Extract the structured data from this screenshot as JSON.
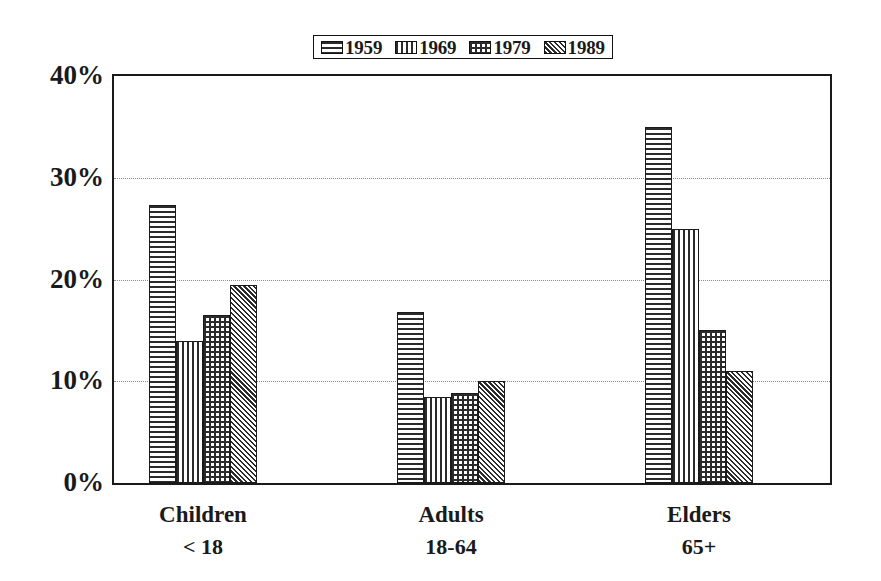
{
  "chart_data": {
    "type": "bar",
    "title": "",
    "subtitle": "",
    "xlabel": "",
    "ylabel": "",
    "ylim": [
      0,
      40
    ],
    "yunit": "%",
    "ytick_labels": [
      "40%",
      "30%",
      "20%",
      "10%",
      "0%"
    ],
    "ytick_values": [
      40,
      30,
      20,
      10,
      0
    ],
    "gridlines": [
      30,
      20,
      10
    ],
    "grid": true,
    "grid_style": "dotted",
    "legend_position": "top-center",
    "categories": [
      "Children",
      "Adults",
      "Elders"
    ],
    "category_sublabels": [
      "< 18",
      "18-64",
      "65+"
    ],
    "series": [
      {
        "name": "1959",
        "pattern": "horizontal",
        "values": [
          27.3,
          16.8,
          35.0
        ]
      },
      {
        "name": "1969",
        "pattern": "vertical",
        "values": [
          14.0,
          8.5,
          25.0
        ]
      },
      {
        "name": "1979",
        "pattern": "grid",
        "values": [
          16.5,
          8.8,
          15.0
        ]
      },
      {
        "name": "1989",
        "pattern": "diagonal",
        "values": [
          19.5,
          10.0,
          11.0
        ]
      }
    ]
  },
  "legend": {
    "entries": [
      {
        "label": "1959",
        "pattern": "horizontal"
      },
      {
        "label": "1969",
        "pattern": "vertical"
      },
      {
        "label": "1979",
        "pattern": "grid"
      },
      {
        "label": "1989",
        "pattern": "diagonal"
      }
    ]
  },
  "colors": {
    "ink": "#1a1a1a",
    "hatch": "#2b2b2b",
    "background": "#ffffff",
    "gridline": "#8c8c8c"
  }
}
